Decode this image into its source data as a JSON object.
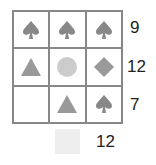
{
  "puzzle": {
    "grid": [
      [
        "spade",
        "spade",
        "spade"
      ],
      [
        "triangle",
        "circle",
        "diamond"
      ],
      [
        "empty",
        "triangle",
        "spade"
      ]
    ],
    "row_sums": [
      "9",
      "12",
      "7"
    ],
    "column_sum": "12",
    "colors": {
      "spade": "#888888",
      "triangle": "#999999",
      "circle": "#cccccc",
      "diamond": "#999999",
      "answer_box": "#eeeeee"
    }
  }
}
